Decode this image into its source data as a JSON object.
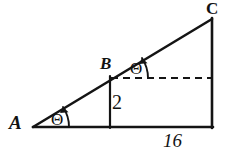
{
  "figure": {
    "background_color": "#ffffff",
    "stroke_color": "#141414",
    "vertices": {
      "A": {
        "label": "A",
        "x": 33,
        "y": 127
      },
      "B": {
        "label": "B",
        "x": 110,
        "y": 76
      },
      "C": {
        "label": "C",
        "x": 212,
        "y": 19
      },
      "base_right": {
        "x": 212,
        "y": 127
      },
      "base_foot_B": {
        "x": 110,
        "y": 127
      }
    },
    "measures": {
      "height_label": "2",
      "base_label": "16"
    },
    "angles": [
      {
        "name": "angle-at-A",
        "label": "Θ",
        "vertex": "A",
        "between": "base and hypotenuse"
      },
      {
        "name": "angle-at-B",
        "label": "Θ",
        "vertex": "B",
        "between": "dashed horizontal and hypotenuse"
      }
    ],
    "segments": [
      {
        "name": "hypotenuse-AC",
        "style": "solid",
        "from": "A",
        "to": "C"
      },
      {
        "name": "base-A-to-right",
        "style": "solid",
        "from": "A",
        "to": "base_right"
      },
      {
        "name": "right-side-C-to-base",
        "style": "solid",
        "from": "C",
        "to": "base_right"
      },
      {
        "name": "height-segment-B",
        "style": "solid",
        "from": "B",
        "to": "base_foot_B"
      },
      {
        "name": "dashed-horizontal-from-B",
        "style": "dashed",
        "from": "B",
        "to": "right side"
      }
    ]
  }
}
